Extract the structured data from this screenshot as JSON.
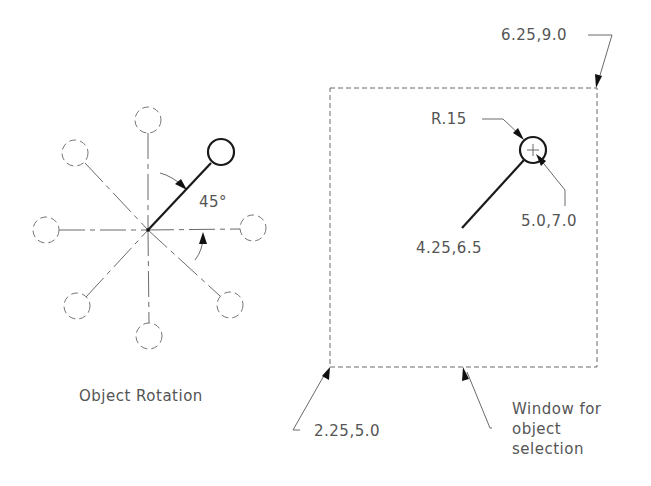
{
  "diagram": {
    "left_panel": {
      "caption": "Object Rotation",
      "angle_label": "45°",
      "pivot": {
        "x": 148,
        "y": 230
      },
      "rotated_object_circle": {
        "cx": 221,
        "cy": 152,
        "r": 13
      },
      "reference_circles": [
        {
          "name": "north",
          "cx": 148,
          "cy": 120,
          "r": 13
        },
        {
          "name": "northwest",
          "cx": 75,
          "cy": 153,
          "r": 13
        },
        {
          "name": "west",
          "cx": 46,
          "cy": 230,
          "r": 13
        },
        {
          "name": "east",
          "cx": 253,
          "cy": 228,
          "r": 13
        },
        {
          "name": "southwest",
          "cx": 77,
          "cy": 306,
          "r": 13
        },
        {
          "name": "southeast",
          "cx": 230,
          "cy": 305,
          "r": 13
        },
        {
          "name": "south",
          "cx": 149,
          "cy": 336,
          "r": 13
        }
      ]
    },
    "right_panel": {
      "window_label_line1": "Window for",
      "window_label_line2": "object",
      "window_label_line3": "selection",
      "top_right_corner_label": "6.25,9.0",
      "bottom_left_corner_label": "2.25,5.0",
      "radius_label": "R.15",
      "circle_center_label": "5.0,7.0",
      "line_start_label": "4.25,6.5",
      "window_rect": {
        "x1": 330,
        "y1": 88,
        "x2": 597,
        "y2": 367
      },
      "object_circle": {
        "cx": 533,
        "cy": 150,
        "r": 13
      },
      "object_line": {
        "x1": 462,
        "y1": 228,
        "x2": 524,
        "y2": 160
      }
    }
  }
}
